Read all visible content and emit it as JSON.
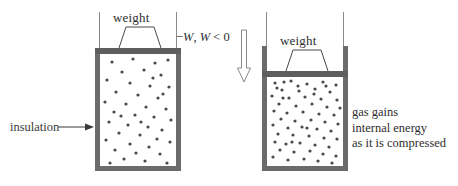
{
  "figure": {
    "colors": {
      "wall": "#6b6b6b",
      "piston": "#5e5e5e",
      "dot": "#4a4a4a",
      "rail": "#8a8a8a",
      "text": "#2e2e2e",
      "background": "#ffffff"
    }
  },
  "left_cylinder": {
    "weight_label": "weight",
    "state": "expanded",
    "geometry": {
      "x": 95,
      "y": 49,
      "width": 86,
      "height": 122
    },
    "gas_dot_count": 44
  },
  "right_cylinder": {
    "weight_label": "weight",
    "state": "compressed",
    "geometry": {
      "x": 262,
      "y": 22,
      "width": 86,
      "height": 149
    },
    "gas_dot_count": 62
  },
  "annotations": {
    "insulation": {
      "label": "insulation",
      "arrow": "right-arrow"
    },
    "work": {
      "minus_sign": "−",
      "symbol_1": "W",
      "comma": ", ",
      "symbol_2": "W",
      "relation": " < 0",
      "full_text": "−W, W < 0",
      "arrow": "down-arrow-outline"
    },
    "result_caption": {
      "line1": "gas gains",
      "line2": "internal energy",
      "line3": "as it is compressed"
    }
  }
}
